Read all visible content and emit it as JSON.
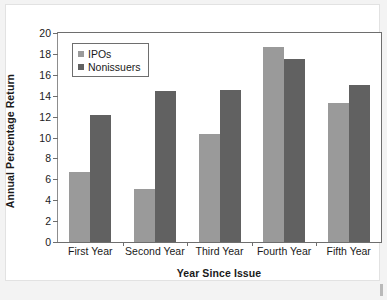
{
  "chart_data": {
    "type": "bar",
    "title": "",
    "xlabel": "Year Since Issue",
    "ylabel": "Annual Percentage Return",
    "categories": [
      "First Year",
      "Second Year",
      "Third Year",
      "Fourth Year",
      "Fifth Year"
    ],
    "series": [
      {
        "name": "IPOs",
        "color": "#9a9a9a",
        "values": [
          6.7,
          5.1,
          10.3,
          18.7,
          13.3
        ]
      },
      {
        "name": "Nonissuers",
        "color": "#616161",
        "values": [
          12.2,
          14.45,
          14.5,
          17.5,
          15.0
        ]
      }
    ],
    "ylim": [
      0,
      20
    ],
    "yticks": [
      0,
      2,
      4,
      6,
      8,
      10,
      12,
      14,
      16,
      18,
      20
    ],
    "ytick_labels": [
      "0",
      "2",
      "4",
      "6",
      "8",
      "10",
      "12",
      "14",
      "16",
      "18",
      "20"
    ],
    "grid": false,
    "legend_position": "upper-left",
    "legend_entries": [
      "IPOs",
      "Nonissuers"
    ]
  },
  "figure": {
    "background_color": "#f3f3f3",
    "canvas_color": "#ffffff",
    "axis_color": "#6e6e6e"
  }
}
